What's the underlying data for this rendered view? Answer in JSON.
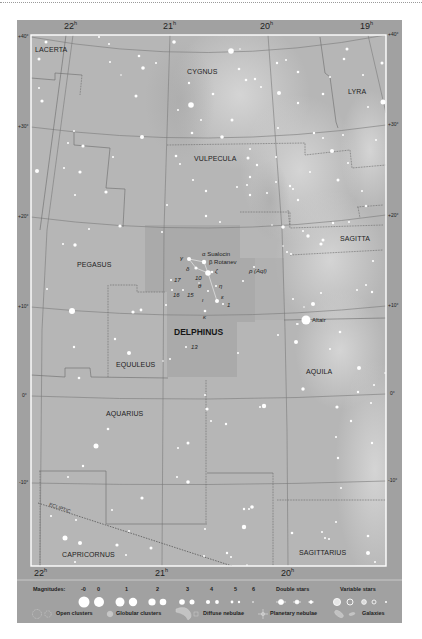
{
  "map": {
    "ra_unit": "h",
    "ra_top": [
      "22",
      "21",
      "20",
      "19"
    ],
    "ra_bottom": [
      "22",
      "21",
      "20"
    ],
    "dec_left": [
      "+40°",
      "+30°",
      "+20°",
      "+10°",
      "0°",
      "-10°"
    ],
    "dec_right": [
      "+40°",
      "+30°",
      "+20°",
      "+10°",
      "0°",
      "-10°"
    ],
    "constellations": {
      "lacerta": "LACERTA",
      "cygnus": "CYGNUS",
      "lyra": "LYRA",
      "vulpecula": "VULPECULA",
      "sagitta": "SAGITTA",
      "pegasus": "PEGASUS",
      "delphinus": "DELPHINUS",
      "equuleus": "EQUULEUS",
      "aquila": "AQUILA",
      "aquarius": "AQUARIUS",
      "capricornus": "CAPRICORNUS",
      "sagittarius": "SAGITTARIUS"
    },
    "ecliptic_label": "ECLIPTIC",
    "star_labels": {
      "alpha": "α Sualocin",
      "beta": "β Rotanev",
      "gamma": "γ",
      "delta": "δ",
      "zeta": "ζ",
      "ten": "10",
      "theta": "θ",
      "eta": "η",
      "seventeen": "17",
      "sixteen": "16",
      "fifteen": "15",
      "iota": "ι",
      "epsilon": "ε",
      "one": "1",
      "kappa": "κ",
      "thirteen": "13",
      "rho_aql": "ρ (Aql)",
      "altair": "Altair"
    },
    "colors": {
      "frame": "#a1a1a1",
      "sky": "#b6b6b6",
      "milky_way": "#d2d2d2",
      "delphinus_area": "#a9a9a9",
      "grid": "#7a7a7a",
      "star": "#ffffff"
    },
    "stars": [
      [
        46,
        42,
        1.5
      ],
      [
        39,
        59,
        1.5
      ],
      [
        39,
        88,
        1
      ],
      [
        42,
        101,
        1.6
      ],
      [
        99,
        37,
        1
      ],
      [
        109,
        44,
        1
      ],
      [
        110,
        62,
        1
      ],
      [
        139,
        56,
        1.3
      ],
      [
        143,
        68,
        1.8
      ],
      [
        156,
        63,
        1
      ],
      [
        121,
        75,
        0.8
      ],
      [
        136,
        96,
        1.5
      ],
      [
        174,
        42,
        1.8
      ],
      [
        231,
        51,
        2.8
      ],
      [
        240,
        49,
        0.8
      ],
      [
        239,
        69,
        1.3
      ],
      [
        246,
        80,
        1.3
      ],
      [
        255,
        79,
        1.2
      ],
      [
        261,
        87,
        1
      ],
      [
        277,
        63,
        1.2
      ],
      [
        286,
        60,
        1
      ],
      [
        298,
        72,
        1.3
      ],
      [
        279,
        93,
        2
      ],
      [
        191,
        105,
        2.8
      ],
      [
        189,
        83,
        1.2
      ],
      [
        213,
        94,
        1.3
      ],
      [
        323,
        94,
        1.3
      ],
      [
        330,
        77,
        1
      ],
      [
        347,
        49,
        1.5
      ],
      [
        344,
        59,
        1.3
      ],
      [
        382,
        63,
        1.5
      ],
      [
        363,
        75,
        1
      ],
      [
        368,
        107,
        1
      ],
      [
        383,
        102,
        2.5
      ],
      [
        298,
        103,
        1.2
      ],
      [
        178,
        110,
        1
      ],
      [
        201,
        120,
        1
      ],
      [
        232,
        120,
        1.5
      ],
      [
        192,
        133,
        1.3
      ],
      [
        222,
        137,
        1.8
      ],
      [
        278,
        128,
        1
      ],
      [
        314,
        133,
        1.2
      ],
      [
        323,
        138,
        1
      ],
      [
        332,
        151,
        2
      ],
      [
        343,
        135,
        1
      ],
      [
        376,
        140,
        1
      ],
      [
        176,
        156,
        1.3
      ],
      [
        180,
        164,
        1
      ],
      [
        250,
        149,
        1
      ],
      [
        248,
        158,
        1.5
      ],
      [
        276,
        157,
        1
      ],
      [
        257,
        165,
        1.2
      ],
      [
        250,
        177,
        1.2
      ],
      [
        193,
        180,
        1.1
      ],
      [
        206,
        191,
        1.2
      ],
      [
        237,
        187,
        1
      ],
      [
        247,
        185,
        1
      ],
      [
        250,
        195,
        1.2
      ],
      [
        267,
        193,
        1
      ],
      [
        276,
        182,
        1
      ],
      [
        290,
        186,
        1.2
      ],
      [
        293,
        189,
        1
      ],
      [
        298,
        200,
        1.2
      ],
      [
        310,
        172,
        1
      ],
      [
        338,
        180,
        1.5
      ],
      [
        348,
        163,
        1
      ],
      [
        167,
        205,
        1
      ],
      [
        206,
        216,
        1.2
      ],
      [
        220,
        222,
        1
      ],
      [
        283,
        227,
        1.8
      ],
      [
        333,
        223,
        1.2
      ],
      [
        349,
        222,
        1
      ],
      [
        362,
        191,
        1
      ],
      [
        366,
        206,
        1.2
      ],
      [
        74,
        131,
        1
      ],
      [
        68,
        143,
        1
      ],
      [
        83,
        146,
        1.6
      ],
      [
        142,
        137,
        2
      ],
      [
        113,
        157,
        1
      ],
      [
        37,
        171,
        2
      ],
      [
        64,
        168,
        1
      ],
      [
        80,
        172,
        1.6
      ],
      [
        75,
        195,
        1
      ],
      [
        106,
        192,
        1.6
      ],
      [
        120,
        226,
        1.6
      ],
      [
        89,
        229,
        1
      ],
      [
        75,
        245,
        1.7
      ],
      [
        63,
        244,
        1
      ],
      [
        303,
        231,
        1
      ],
      [
        308,
        236,
        1.7
      ],
      [
        323,
        240,
        1.5
      ],
      [
        321,
        244,
        1.6
      ],
      [
        283,
        246,
        0.8
      ],
      [
        287,
        252,
        1
      ],
      [
        291,
        254,
        1
      ],
      [
        373,
        261,
        1.1
      ],
      [
        366,
        285,
        1
      ],
      [
        372,
        292,
        1.2
      ],
      [
        357,
        290,
        1
      ],
      [
        321,
        293,
        1
      ],
      [
        313,
        304,
        2
      ],
      [
        304,
        307,
        0.8
      ],
      [
        293,
        299,
        1
      ],
      [
        306,
        320,
        4.5
      ],
      [
        298,
        324,
        0.8
      ],
      [
        340,
        332,
        1.3
      ],
      [
        162,
        232,
        1
      ],
      [
        272,
        225,
        0.8
      ],
      [
        189,
        259,
        2
      ],
      [
        204,
        262,
        2.2
      ],
      [
        196,
        268,
        1.6
      ],
      [
        208,
        273,
        2.8
      ],
      [
        212,
        272,
        1.3
      ],
      [
        199,
        283,
        0.8
      ],
      [
        216,
        286,
        1
      ],
      [
        171,
        280,
        1
      ],
      [
        172,
        290,
        1
      ],
      [
        183,
        290,
        1
      ],
      [
        208,
        291,
        1
      ],
      [
        217,
        301,
        2
      ],
      [
        223,
        304,
        1
      ],
      [
        205,
        311,
        1.3
      ],
      [
        254,
        267,
        1
      ],
      [
        243,
        281,
        1
      ],
      [
        166,
        305,
        1
      ],
      [
        133,
        312,
        1.6
      ],
      [
        141,
        310,
        1.4
      ],
      [
        186,
        347,
        1
      ],
      [
        238,
        353,
        1
      ],
      [
        170,
        359,
        1
      ],
      [
        163,
        361,
        0.8
      ],
      [
        278,
        335,
        1
      ],
      [
        296,
        342,
        2
      ],
      [
        297,
        324,
        1
      ],
      [
        47,
        289,
        1
      ],
      [
        72,
        311,
        3
      ],
      [
        115,
        339,
        1.2
      ],
      [
        74,
        347,
        1.2
      ],
      [
        129,
        353,
        2
      ],
      [
        79,
        378,
        1.3
      ],
      [
        108,
        429,
        1.3
      ],
      [
        330,
        349,
        1
      ],
      [
        359,
        368,
        2
      ],
      [
        303,
        389,
        1.7
      ],
      [
        374,
        385,
        1
      ],
      [
        358,
        392,
        1.2
      ],
      [
        385,
        373,
        0.8
      ],
      [
        205,
        395,
        1
      ],
      [
        264,
        406,
        2.2
      ],
      [
        260,
        407,
        1
      ],
      [
        207,
        409,
        1.6
      ],
      [
        337,
        407,
        1.6
      ],
      [
        371,
        403,
        1
      ],
      [
        211,
        421,
        1
      ],
      [
        226,
        424,
        1.2
      ],
      [
        351,
        421,
        1.2
      ],
      [
        336,
        437,
        1
      ],
      [
        372,
        443,
        1.2
      ],
      [
        96,
        446,
        2.5
      ],
      [
        188,
        443,
        1.5
      ],
      [
        178,
        448,
        1
      ],
      [
        338,
        458,
        1.2
      ],
      [
        83,
        466,
        1.2
      ],
      [
        68,
        477,
        1
      ],
      [
        177,
        477,
        1
      ],
      [
        188,
        482,
        1.8
      ],
      [
        341,
        488,
        1
      ],
      [
        142,
        498,
        1.6
      ],
      [
        112,
        510,
        1
      ],
      [
        51,
        516,
        1
      ],
      [
        76,
        520,
        1
      ],
      [
        244,
        509,
        1.2
      ],
      [
        252,
        507,
        1.8
      ],
      [
        249,
        509,
        1
      ],
      [
        205,
        529,
        1
      ],
      [
        244,
        527,
        2.2
      ],
      [
        129,
        531,
        1
      ],
      [
        336,
        522,
        1
      ],
      [
        292,
        533,
        1.3
      ],
      [
        322,
        532,
        1
      ],
      [
        325,
        538,
        1
      ],
      [
        329,
        539,
        1
      ],
      [
        368,
        536,
        1.3
      ],
      [
        65,
        538,
        2.5
      ],
      [
        80,
        543,
        2
      ],
      [
        117,
        545,
        1.6
      ],
      [
        151,
        548,
        1.5
      ],
      [
        126,
        555,
        1
      ],
      [
        227,
        553,
        1.2
      ],
      [
        231,
        557,
        1
      ],
      [
        204,
        556,
        1
      ],
      [
        368,
        553,
        2
      ],
      [
        75,
        562,
        1
      ],
      [
        375,
        562,
        1
      ],
      [
        247,
        565,
        0.8
      ]
    ]
  },
  "legend": {
    "magnitudes_label": "Magnitudes:",
    "magnitudes": [
      "-0",
      "0",
      "1",
      "2",
      "3",
      "4",
      "5",
      "6"
    ],
    "double_stars": "Double stars",
    "variable_stars": "Variable stars",
    "open_clusters": "Open clusters",
    "globular_clusters": "Globular clusters",
    "diffuse_nebulae": "Diffuse nebulae",
    "planetary_nebulae": "Planetary nebulae",
    "galaxies": "Galaxies"
  }
}
